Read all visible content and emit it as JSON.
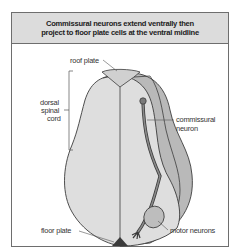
{
  "figure": {
    "title": "Commissural neurons extend ventrally then\nproject to floor plate cells at the ventral midline",
    "labels": {
      "roof_plate": "roof plate",
      "dorsal_line1": "dorsal",
      "dorsal_line2": "spinal",
      "dorsal_line3": "cord",
      "commissural_line1": "commissural",
      "commissural_line2": "neuron",
      "floor_plate": "floor plate",
      "motor_neurons": "motor neurons"
    },
    "colors": {
      "header_bg": "#dcdcdc",
      "cord_fill": "#dedede",
      "side_fill": "#b9b9b9",
      "neuron": "#6a6a6a",
      "floor_plate": "#3a3a3a",
      "outline": "#3c3c3c"
    }
  }
}
